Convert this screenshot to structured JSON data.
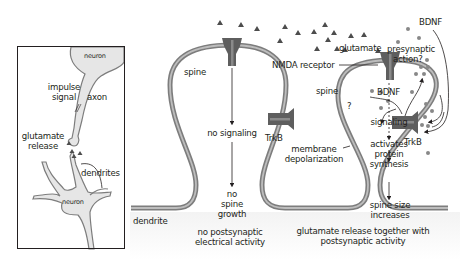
{
  "colors": {
    "membrane_outer": "#7d7d7d",
    "membrane_inner": "#b3b3b3",
    "receptor": "#5e5e5e",
    "receptor_light": "#8a8a8a",
    "neuron_fill": "#e6e6e6",
    "glutamate": "#4d4d4d",
    "bdnf_dot": "#888888",
    "text": "#231f20"
  },
  "inset": {
    "top_neuron_label": "neuron",
    "impulse_label_line1": "impulse",
    "impulse_label_line2": "signal",
    "axon_label": "axon",
    "glutamate_label_line1": "glutamate",
    "glutamate_label_line2": "release",
    "dendrites_label": "dendrites",
    "bottom_neuron_label": "neuron"
  },
  "left_spine": {
    "spine_label": "spine",
    "no_signaling": "no signaling",
    "trkb_label": "TrkB",
    "outcome_line1": "no",
    "outcome_line2": "spine",
    "outcome_line3": "growth",
    "caption_line1": "no postsynaptic",
    "caption_line2": "electrical activity"
  },
  "dendrite_label": "dendrite",
  "middle": {
    "membrane_depol_line1": "membrane",
    "membrane_depol_line2": "depolarization"
  },
  "right_spine": {
    "nmda_label": "NMDA receptor",
    "glutamate_label": "glutamate",
    "spine_label": "spine",
    "question": "?",
    "signaling": "signaling",
    "activates_line1": "activates",
    "activates_line2": "protein",
    "activates_line3": "synthesis",
    "outcome_line1": "spine size",
    "outcome_line2": "increases",
    "bdnf_inner_label": "BDNF",
    "trkb_label": "TrkB",
    "caption_line1": "glutamate release together with",
    "caption_line2": "postsynaptic activity"
  },
  "presynaptic": {
    "bdnf_label": "BDNF",
    "action_line1": "presynaptic",
    "action_line2": "action?"
  }
}
